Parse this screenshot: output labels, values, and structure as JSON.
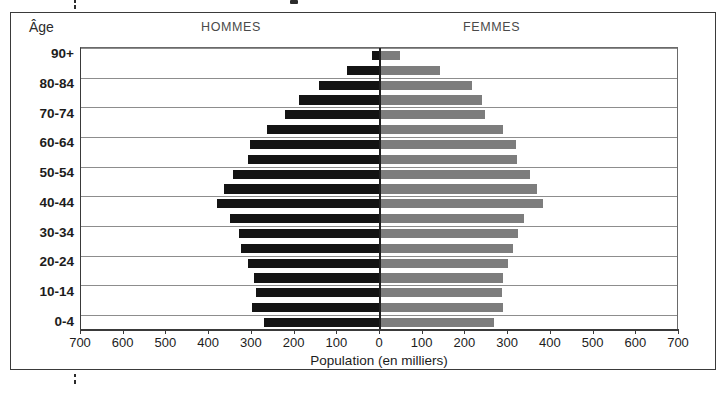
{
  "chart_data": {
    "type": "bar",
    "subtype": "population-pyramid",
    "title": "",
    "xlabel": "Population (en milliers)",
    "ylabel": "Âge",
    "categories": [
      "0-4",
      "5-9",
      "10-14",
      "15-19",
      "20-24",
      "25-29",
      "30-34",
      "35-39",
      "40-44",
      "45-49",
      "50-54",
      "55-59",
      "60-64",
      "65-69",
      "70-74",
      "75-79",
      "80-84",
      "85-89",
      "90+"
    ],
    "series": [
      {
        "name": "HOMMES",
        "color": "#141414",
        "values": [
          272,
          300,
          290,
          295,
          310,
          325,
          330,
          352,
          382,
          365,
          345,
          310,
          305,
          265,
          222,
          190,
          143,
          78,
          19
        ]
      },
      {
        "name": "FEMMES",
        "color": "#7d7d7d",
        "values": [
          268,
          288,
          286,
          288,
          300,
          312,
          322,
          338,
          382,
          368,
          352,
          320,
          318,
          288,
          245,
          238,
          215,
          140,
          47
        ]
      }
    ],
    "xlim": [
      -700,
      700
    ],
    "x_ticks": [
      {
        "value": -700,
        "label": "700"
      },
      {
        "value": -600,
        "label": "600"
      },
      {
        "value": -500,
        "label": "500"
      },
      {
        "value": -400,
        "label": "400"
      },
      {
        "value": -300,
        "label": "300"
      },
      {
        "value": -200,
        "label": "200"
      },
      {
        "value": -100,
        "label": "100"
      },
      {
        "value": 0,
        "label": "0"
      },
      {
        "value": 100,
        "label": "100"
      },
      {
        "value": 200,
        "label": "200"
      },
      {
        "value": 300,
        "label": "300"
      },
      {
        "value": 400,
        "label": "400"
      },
      {
        "value": 500,
        "label": "500"
      },
      {
        "value": 600,
        "label": "600"
      },
      {
        "value": 700,
        "label": "700"
      }
    ],
    "y_tick_labels": [
      "0-4",
      "10-14",
      "20-24",
      "30-34",
      "40-44",
      "50-54",
      "60-64",
      "70-74",
      "80-84",
      "90+"
    ],
    "grid": true,
    "grid_orientation": "horizontal",
    "grid_every_n_rows": 2,
    "legend_position": "top",
    "center_axis": true
  },
  "header": {
    "age_axis_label": "Âge",
    "men_label": "HOMMES",
    "women_label": "FEMMES"
  },
  "axis": {
    "x_title": "Population (en milliers)"
  }
}
